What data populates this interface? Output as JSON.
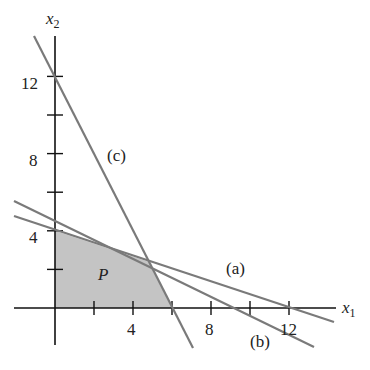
{
  "diagram": {
    "axes": {
      "x_label": "x",
      "x_sub": "1",
      "y_label": "x",
      "y_sub": "2",
      "x_ticks": [
        2,
        4,
        6,
        8,
        10,
        12
      ],
      "x_tick_labels": [
        {
          "value": 4,
          "text": "4"
        },
        {
          "value": 8,
          "text": "8"
        },
        {
          "value": 12,
          "text": "12"
        }
      ],
      "y_ticks": [
        2,
        4,
        6,
        8,
        10,
        12
      ],
      "y_tick_labels": [
        {
          "value": 4,
          "text": "4"
        },
        {
          "value": 8,
          "text": "8"
        },
        {
          "value": 12,
          "text": "12"
        }
      ]
    },
    "lines": [
      {
        "label": "(a)",
        "equation": "x1 + 3x2 = 12"
      },
      {
        "label": "(b)",
        "equation": "x1 + 2x2 = 9"
      },
      {
        "label": "(c)",
        "equation": "2x1 + x2 = 12"
      }
    ],
    "region": {
      "label": "P",
      "vertices": [
        [
          0,
          0
        ],
        [
          6,
          0
        ],
        [
          4.8,
          2.4
        ],
        [
          0,
          4
        ]
      ],
      "fill": "#c4c4c4"
    },
    "line_color": "#7a7a7a"
  }
}
